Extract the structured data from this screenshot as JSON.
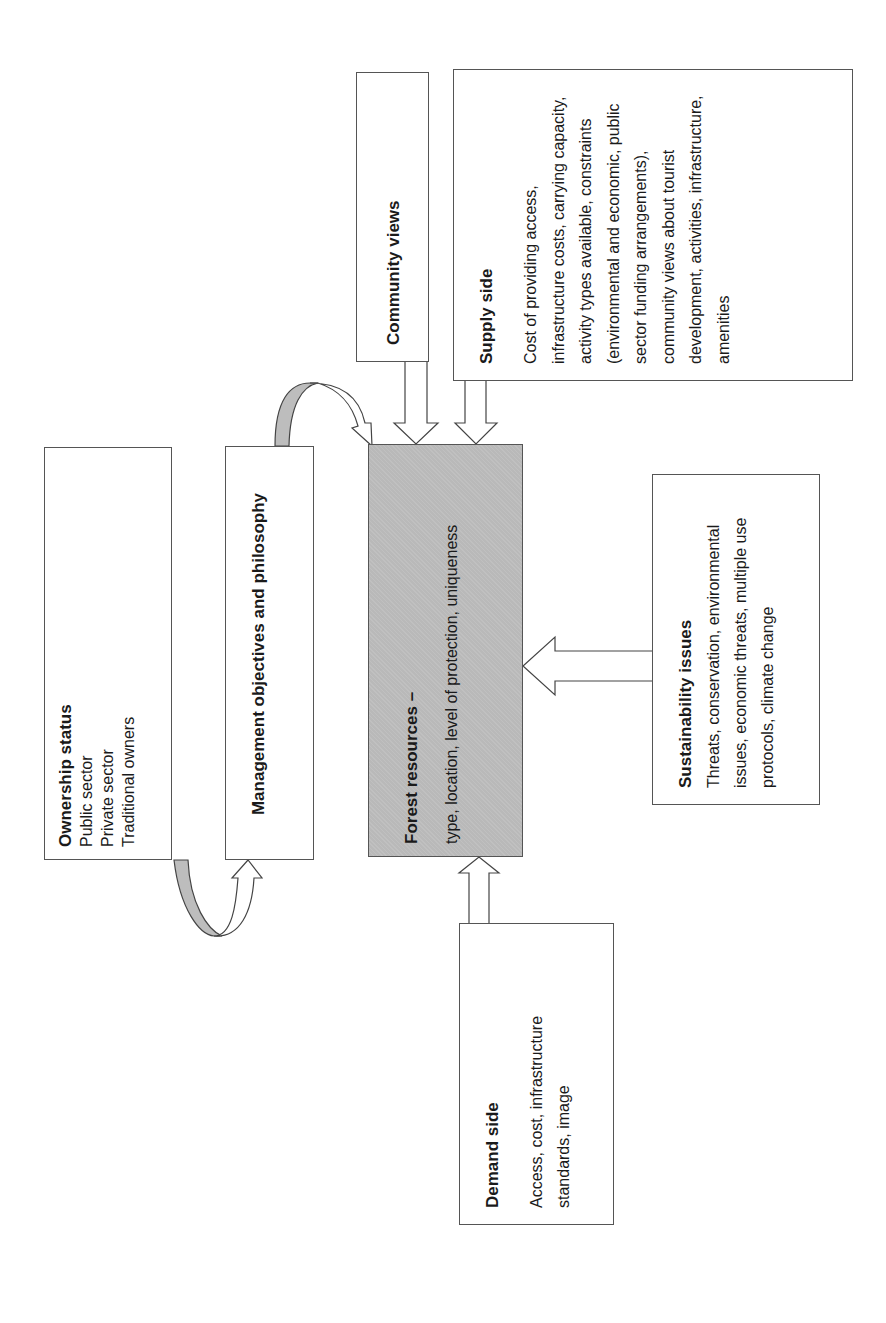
{
  "diagram": {
    "orientation": "rotated-90-ccw",
    "colors": {
      "border": "#555555",
      "shaded_fill": "#b9b9b9",
      "arrow_band_fill": "#bdbdbd",
      "background": "#ffffff"
    },
    "nodes": {
      "ownership": {
        "title": "Ownership status",
        "items": [
          "Public sector",
          "Private sector",
          "Traditional owners"
        ]
      },
      "management": {
        "title": "Management objectives and philosophy"
      },
      "forest": {
        "title": "Forest resources –",
        "body": "type, location, level of protection, uniqueness"
      },
      "community": {
        "title": "Community views"
      },
      "supply": {
        "title": "Supply side",
        "body": "Cost of providing access, infrastructure costs, carrying capacity, activity types available, constraints (environmental and economic, public sector funding arrangements), community views about tourist development, activities, infrastructure, amenities"
      },
      "sustainability": {
        "title": "Sustainability issues",
        "body": "Threats, conservation, environmental issues, economic threats, multiple use protocols, climate change"
      },
      "demand": {
        "title": "Demand side",
        "body": "Access, cost, infrastructure standards, image"
      }
    },
    "edges": [
      {
        "from": "ownership",
        "to": "management",
        "style": "curved-arrow"
      },
      {
        "from": "management",
        "to": "forest",
        "style": "curved-arrow"
      },
      {
        "from": "community",
        "to": "forest",
        "style": "block-arrow"
      },
      {
        "from": "supply",
        "to": "forest",
        "style": "block-arrow"
      },
      {
        "from": "sustainability",
        "to": "forest",
        "style": "block-arrow"
      },
      {
        "from": "demand",
        "to": "forest",
        "style": "block-arrow"
      }
    ]
  }
}
